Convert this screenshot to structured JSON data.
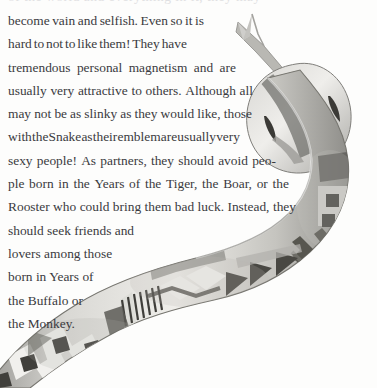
{
  "page": {
    "width": 377,
    "height": 388,
    "background_color": "#ffffff",
    "text_color": "#3a3a40",
    "kind": "scanned-book-page"
  },
  "top_clipped_line": "of the world and everything in it, they may",
  "body": {
    "lines": [
      "become vain and selfish. Even so it is",
      "hard to not to like them! They have",
      "tremendous personal magnetism and are",
      "usually very attractive to others. Although all",
      "may not be as slinky as they would like, those",
      "with the Snake as their emblem are usually very",
      "sexy people! As partners, they should avoid peo-",
      "ple born in the Years of the Tiger, the Boar, or the",
      "Rooster who could bring them bad luck. Instead, they",
      "should seek friends and",
      "lovers among those",
      "born in Years of",
      "the Buffalo or",
      "the Monkey."
    ],
    "full_text": "become vain and selfish. Even so it is hard to not to like them! They have tremendous personal magnetism and are usually very attractive to others. Although all may not be as slinky as they would like, those with the Snake as their emblem are usually very sexy people! As partners, they should avoid people born in the Years of the Tiger, the Boar, or the Rooster who could bring them bad luck. Instead, they should seek friends and lovers among those born in Years of the Buffalo or the Monkey."
  },
  "illustration": {
    "name": "decorated-snake",
    "description": "Grayscale watercolor snake with forked tongue entering from upper right, body curving down and exiting at lower left, covered in geometric folk-art patterns",
    "features": [
      "forked-tongue",
      "snake-head",
      "eye-spots",
      "zigzag-band",
      "triangle-band",
      "square-band",
      "stripe-band",
      "chevron-band"
    ],
    "palette": {
      "light": "#e6e5e1",
      "mid": "#bdbcb7",
      "dark": "#8a8985",
      "darkest": "#4f4e4c",
      "outline": "#6b6a67"
    }
  }
}
